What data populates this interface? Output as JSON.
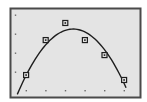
{
  "chart_data": {
    "type": "scatter",
    "title": "",
    "xlabel": "",
    "ylabel": "",
    "grid": false,
    "legend": null,
    "xlim": [
      0.55,
      6.1
    ],
    "ylim": [
      -0.05,
      4.2
    ],
    "x_ticks": [
      1,
      2,
      3,
      4,
      5,
      6
    ],
    "y_ticks": [
      1,
      2,
      3,
      4
    ],
    "series": [
      {
        "name": "data points",
        "marker": "square",
        "x": [
          1,
          2,
          3,
          4,
          5,
          6
        ],
        "y": [
          0.84,
          2.68,
          3.58,
          2.68,
          1.89,
          0.58
        ]
      },
      {
        "name": "quadratic fit",
        "type": "line",
        "curve": "parabola",
        "vertex": [
          3.4,
          3.26
        ],
        "roots": [
          0.55,
          6.1
        ]
      }
    ]
  },
  "style": {
    "background": "#ffffff",
    "plot_fill": "#e4e4e4",
    "frame_color": "#4a4a4a",
    "ink": "#1e1e1e",
    "tick_color": "#6a6a6a"
  },
  "layout": {
    "frame": {
      "x": 10,
      "y": 8,
      "w": 130,
      "h": 89
    },
    "origin_px": {
      "x": 6.5,
      "y": 91
    },
    "unit_px": {
      "x": 19.6,
      "y": 19
    }
  }
}
